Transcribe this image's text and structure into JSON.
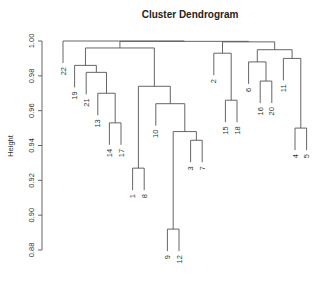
{
  "chart_data": {
    "type": "dendrogram",
    "title": "Cluster Dendrogram",
    "xlabel": "",
    "ylabel": "Height",
    "ylim": [
      0.88,
      1.0
    ],
    "yticks": [
      0.88,
      0.9,
      0.92,
      0.94,
      0.96,
      0.98,
      1.0
    ],
    "ytick_labels": [
      "0.88",
      "0.90",
      "0.92",
      "0.94",
      "0.96",
      "0.98",
      "1.00"
    ],
    "leaf_order": [
      "22",
      "19",
      "21",
      "13",
      "14",
      "17",
      "1",
      "8",
      "10",
      "9",
      "12",
      "3",
      "7",
      "2",
      "15",
      "18",
      "6",
      "16",
      "20",
      "11",
      "4",
      "5"
    ],
    "leaf_heights_hang": 0.006,
    "merges": [
      {
        "id": "m14_17",
        "left": "14",
        "right": "17",
        "height": 0.953
      },
      {
        "id": "m13",
        "left": "13",
        "right": "m14_17",
        "height": 0.97
      },
      {
        "id": "m21",
        "left": "21",
        "right": "m13",
        "height": 0.982
      },
      {
        "id": "m19",
        "left": "19",
        "right": "m21",
        "height": 0.986
      },
      {
        "id": "m1_8",
        "left": "1",
        "right": "8",
        "height": 0.927
      },
      {
        "id": "m9_12",
        "left": "9",
        "right": "12",
        "height": 0.892
      },
      {
        "id": "m3_7",
        "left": "3",
        "right": "7",
        "height": 0.943
      },
      {
        "id": "m9_3",
        "left": "m9_12",
        "right": "m3_7",
        "height": 0.948
      },
      {
        "id": "m10",
        "left": "10",
        "right": "m9_3",
        "height": 0.964
      },
      {
        "id": "m1_10",
        "left": "m1_8",
        "right": "m10",
        "height": 0.974
      },
      {
        "id": "m19_1",
        "left": "m19",
        "right": "m1_10",
        "height": 0.996
      },
      {
        "id": "m15_18",
        "left": "15",
        "right": "18",
        "height": 0.966
      },
      {
        "id": "m2",
        "left": "2",
        "right": "m15_18",
        "height": 0.993
      },
      {
        "id": "m16_20",
        "left": "16",
        "right": "20",
        "height": 0.977
      },
      {
        "id": "m6",
        "left": "6",
        "right": "m16_20",
        "height": 0.988
      },
      {
        "id": "m4_5",
        "left": "4",
        "right": "5",
        "height": 0.95
      },
      {
        "id": "m11",
        "left": "11",
        "right": "m4_5",
        "height": 0.99
      },
      {
        "id": "m6_11",
        "left": "m6",
        "right": "m11",
        "height": 0.995
      },
      {
        "id": "m2_6",
        "left": "m2",
        "right": "m6_11",
        "height": 0.9995
      },
      {
        "id": "mleft_right",
        "left": "m19_1",
        "right": "m2_6",
        "height": 0.9998
      },
      {
        "id": "root",
        "left": "22",
        "right": "mleft_right",
        "height": 1.0
      }
    ]
  }
}
